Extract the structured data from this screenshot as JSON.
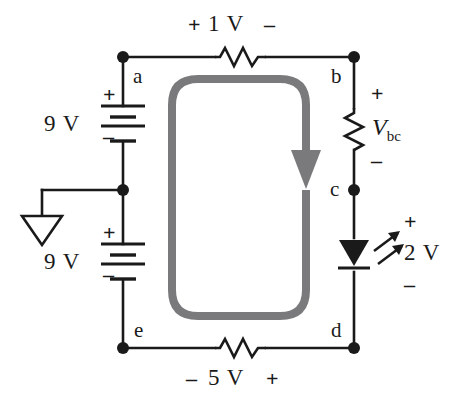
{
  "figure": {
    "colors": {
      "wire": "#1a1a1a",
      "loop_arrow": "#7a7a7d",
      "background": "#ffffff"
    }
  },
  "nodes": {
    "a": "a",
    "b": "b",
    "c": "c",
    "d": "d",
    "e": "e"
  },
  "elements": {
    "top_resistor": {
      "name": "top-resistor",
      "plus": "+",
      "value": "1 V",
      "minus": "–"
    },
    "bottom_resistor": {
      "name": "bottom-resistor",
      "minus": "–",
      "value": "5 V",
      "plus": "+"
    },
    "right_resistor": {
      "name": "resistor-bc",
      "plus": "+",
      "label_v": "V",
      "label_sub": "bc",
      "minus": "–"
    },
    "led": {
      "name": "led-cd",
      "plus": "+",
      "value": "2 V",
      "minus": "–"
    },
    "battery_top": {
      "name": "battery-9v-top",
      "value": "9 V",
      "plus": "+",
      "minus": "–"
    },
    "battery_bottom": {
      "name": "battery-9v-bottom",
      "value": "9 V",
      "plus": "+",
      "minus": "–"
    },
    "ground": {
      "name": "ground-symbol"
    },
    "loop": {
      "name": "kvl-loop-arrow",
      "direction": "clockwise"
    }
  }
}
